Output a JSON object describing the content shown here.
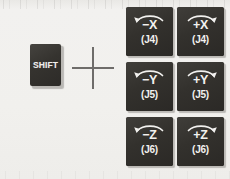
{
  "diagram": {
    "colors": {
      "page_background": "#f1f0ee",
      "key_face": "#33312d",
      "key_text": "#f2f1ef",
      "key_highlight": "#bbb9b5",
      "plus_sign": "#6e6c6a"
    },
    "modifier_key": {
      "label": "SHIFT"
    },
    "combiner": {
      "symbol": "+"
    },
    "keys": [
      {
        "axis_label": "−X",
        "joint_label": "(J4)",
        "direction": "negative",
        "arrow": "arc-arrow-left"
      },
      {
        "axis_label": "+X",
        "joint_label": "(J4)",
        "direction": "positive",
        "arrow": "arc-arrow-right"
      },
      {
        "axis_label": "−Y",
        "joint_label": "(J5)",
        "direction": "negative",
        "arrow": "arc-arrow-left"
      },
      {
        "axis_label": "+Y",
        "joint_label": "(J5)",
        "direction": "positive",
        "arrow": "arc-arrow-right"
      },
      {
        "axis_label": "−Z",
        "joint_label": "(J6)",
        "direction": "negative",
        "arrow": "arc-arrow-left"
      },
      {
        "axis_label": "+Z",
        "joint_label": "(J6)",
        "direction": "positive",
        "arrow": "arc-arrow-right"
      }
    ]
  }
}
